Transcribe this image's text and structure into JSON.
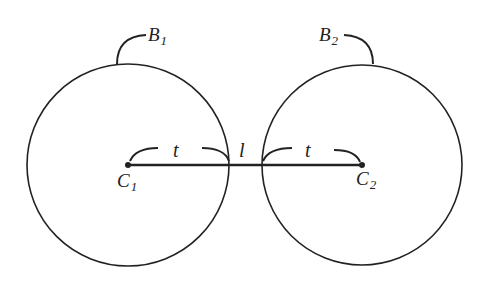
{
  "diagram": {
    "labels": {
      "B1": "B",
      "B1_sub": "1",
      "B2": "B",
      "B2_sub": "2",
      "C1": "C",
      "C1_sub": "1",
      "C2": "C",
      "C2_sub": "2",
      "t_left": "t",
      "t_right": "t",
      "l_middle": "l"
    },
    "circles": [
      {
        "name": "B1",
        "cx": 128,
        "cy": 165,
        "r": 101
      },
      {
        "name": "B2",
        "cx": 362,
        "cy": 165,
        "r": 100
      }
    ],
    "segment": {
      "from": "C1",
      "to": "C2"
    },
    "colors": {
      "stroke": "#222222",
      "background": "#ffffff"
    }
  }
}
